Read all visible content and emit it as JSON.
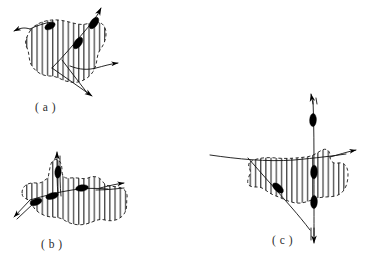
{
  "figure": {
    "kind": "line-drawing",
    "background_color": "#ffffff",
    "ink_color": "#111111",
    "node_color": "#000000",
    "hatch_color": "#1a1a1a",
    "panels": [
      {
        "id": "a",
        "label": "( a )",
        "label_x": 35,
        "label_y": 101,
        "region_name": "hatched-blob-a",
        "curves": [
          {
            "name": "diagonal-curve-a",
            "direction": "upper-right",
            "node_count": 2
          },
          {
            "name": "horizontal-curve-a",
            "direction": "right",
            "node_count": 0
          }
        ],
        "arrows": [
          {
            "name": "arrow-a-left",
            "points": "left"
          },
          {
            "name": "arrow-a-top",
            "points": "upper-right"
          },
          {
            "name": "arrow-a-bottom",
            "points": "lower-left"
          },
          {
            "name": "arrow-a-right",
            "points": "right"
          }
        ]
      },
      {
        "id": "b",
        "label": "( b )",
        "label_x": 41,
        "label_y": 238,
        "region_name": "hatched-blob-b",
        "curves": [
          {
            "name": "diagonal-curve-b",
            "direction": "upper-right",
            "node_count": 1
          },
          {
            "name": "horizontal-curve-b",
            "direction": "right",
            "node_count": 2
          },
          {
            "name": "vertical-curve-b",
            "direction": "up",
            "node_count": 1
          }
        ],
        "arrows": [
          {
            "name": "arrow-b-top",
            "points": "up"
          },
          {
            "name": "arrow-b-right",
            "points": "right"
          },
          {
            "name": "arrow-b-lower-left",
            "points": "lower-left"
          }
        ]
      },
      {
        "id": "c",
        "label": "( c )",
        "label_x": 272,
        "label_y": 234,
        "region_name": "hatched-blob-c",
        "curves": [
          {
            "name": "vertical-curve-c",
            "direction": "vertical",
            "node_count": 3
          },
          {
            "name": "horizontal-curve-c",
            "direction": "right",
            "node_count": 0
          },
          {
            "name": "diagonal-curve-c",
            "direction": "lower-right",
            "node_count": 1
          }
        ],
        "arrows": [
          {
            "name": "arrow-c-top",
            "points": "up"
          },
          {
            "name": "arrow-c-bottom",
            "points": "down"
          },
          {
            "name": "arrow-c-right",
            "points": "right"
          }
        ]
      }
    ]
  }
}
